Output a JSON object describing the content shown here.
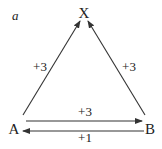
{
  "panel_label": "a",
  "nodes": {
    "x": {
      "label": "X"
    },
    "a": {
      "label": "A"
    },
    "b": {
      "label": "B"
    }
  },
  "edges": [
    {
      "from": "A",
      "to": "X",
      "label": "+3"
    },
    {
      "from": "B",
      "to": "X",
      "label": "+3"
    },
    {
      "from": "A",
      "to": "B",
      "label": "+3"
    },
    {
      "from": "B",
      "to": "A",
      "label": "+1"
    }
  ],
  "colors": {
    "stroke": "#333333",
    "text": "#222222",
    "background": "#ffffff"
  }
}
